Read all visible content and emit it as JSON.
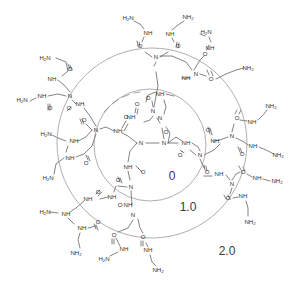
{
  "figure": {
    "type": "chemical-structure-diagram",
    "background_color": "#ffffff",
    "bond_color": "#5a5a5a",
    "circle_color": "#8d8d8d",
    "label_color": "#3a3a3a"
  },
  "generation_labels": [
    {
      "text": "0",
      "x": 172,
      "y": 177
    },
    {
      "text": "1.0",
      "x": 188,
      "y": 208
    },
    {
      "text": "2.0",
      "x": 227,
      "y": 252
    }
  ],
  "generation_circles": [
    {
      "name": "generation-0-boundary",
      "cx": 150,
      "cy": 145,
      "r": 56
    },
    {
      "name": "generation-1-boundary",
      "cx": 152,
      "cy": 143,
      "r": 95
    }
  ],
  "chart_data": {
    "type": "diagram",
    "annotations": [
      "0",
      "1.0",
      "2.0"
    ],
    "core": {
      "label": "ethylenediamine core",
      "atoms": [
        "N",
        "N"
      ]
    },
    "atom_labels": [
      "N",
      "NH",
      "O",
      "NH2",
      "H2N"
    ],
    "generations": [
      {
        "label": "0",
        "radius": 56,
        "terminal_groups": 4
      },
      {
        "label": "1.0",
        "radius": 95,
        "terminal_groups": 8
      },
      {
        "label": "2.0",
        "radius": 140,
        "terminal_groups": 16
      }
    ]
  },
  "atoms": [
    {
      "t": "N",
      "x": 141,
      "y": 143
    },
    {
      "t": "N",
      "x": 164,
      "y": 143
    },
    {
      "t": "NH",
      "x": 118,
      "y": 131
    },
    {
      "t": "O",
      "x": 126,
      "y": 117
    },
    {
      "t": "N",
      "x": 96,
      "y": 130
    },
    {
      "t": "O",
      "x": 84,
      "y": 120
    },
    {
      "t": "NH",
      "x": 74,
      "y": 141
    },
    {
      "t": "H2N",
      "x": 46,
      "y": 134
    },
    {
      "t": "NH",
      "x": 70,
      "y": 158
    },
    {
      "t": "O",
      "x": 86,
      "y": 163
    },
    {
      "t": "H2N",
      "x": 48,
      "y": 178
    },
    {
      "t": "NH",
      "x": 128,
      "y": 167
    },
    {
      "t": "O",
      "x": 143,
      "y": 172
    },
    {
      "t": "N",
      "x": 131,
      "y": 187
    },
    {
      "t": "O",
      "x": 118,
      "y": 180
    },
    {
      "t": "NH",
      "x": 112,
      "y": 197
    },
    {
      "t": "NH",
      "x": 88,
      "y": 199
    },
    {
      "t": "O",
      "x": 98,
      "y": 192
    },
    {
      "t": "H2N",
      "x": 45,
      "y": 212
    },
    {
      "t": "NH",
      "x": 66,
      "y": 214
    },
    {
      "t": "O",
      "x": 98,
      "y": 222
    },
    {
      "t": "NH",
      "x": 82,
      "y": 228
    },
    {
      "t": "NH2",
      "x": 76,
      "y": 253
    },
    {
      "t": "N",
      "x": 133,
      "y": 215
    },
    {
      "t": "O",
      "x": 120,
      "y": 205
    },
    {
      "t": "NH",
      "x": 128,
      "y": 205
    },
    {
      "t": "O",
      "x": 114,
      "y": 235
    },
    {
      "t": "NH",
      "x": 124,
      "y": 249
    },
    {
      "t": "H2N",
      "x": 104,
      "y": 259
    },
    {
      "t": "O",
      "x": 143,
      "y": 237
    },
    {
      "t": "NH",
      "x": 148,
      "y": 250
    },
    {
      "t": "NH2",
      "x": 158,
      "y": 270
    },
    {
      "t": "NH",
      "x": 131,
      "y": 117
    },
    {
      "t": "O",
      "x": 137,
      "y": 104
    },
    {
      "t": "N",
      "x": 153,
      "y": 111
    },
    {
      "t": "O",
      "x": 148,
      "y": 98
    },
    {
      "t": "NH",
      "x": 160,
      "y": 94
    },
    {
      "t": "N",
      "x": 160,
      "y": 118
    },
    {
      "t": "N",
      "x": 156,
      "y": 57
    },
    {
      "t": "O",
      "x": 140,
      "y": 46
    },
    {
      "t": "NH",
      "x": 148,
      "y": 33
    },
    {
      "t": "H2N",
      "x": 128,
      "y": 18
    },
    {
      "t": "NH",
      "x": 170,
      "y": 34
    },
    {
      "t": "O",
      "x": 178,
      "y": 46
    },
    {
      "t": "NH2",
      "x": 188,
      "y": 17
    },
    {
      "t": "N",
      "x": 196,
      "y": 74
    },
    {
      "t": "NH",
      "x": 186,
      "y": 78
    },
    {
      "t": "O",
      "x": 205,
      "y": 54
    },
    {
      "t": "NH",
      "x": 210,
      "y": 48
    },
    {
      "t": "H2N",
      "x": 206,
      "y": 32
    },
    {
      "t": "O",
      "x": 211,
      "y": 79
    },
    {
      "t": "NH2",
      "x": 248,
      "y": 68
    },
    {
      "t": "NH",
      "x": 186,
      "y": 143
    },
    {
      "t": "O",
      "x": 180,
      "y": 155
    },
    {
      "t": "N",
      "x": 200,
      "y": 155
    },
    {
      "t": "O",
      "x": 166,
      "y": 132
    },
    {
      "t": "N",
      "x": 232,
      "y": 136
    },
    {
      "t": "O",
      "x": 237,
      "y": 118
    },
    {
      "t": "NH",
      "x": 252,
      "y": 122
    },
    {
      "t": "NH2",
      "x": 271,
      "y": 106
    },
    {
      "t": "NH",
      "x": 253,
      "y": 146
    },
    {
      "t": "O",
      "x": 242,
      "y": 154
    },
    {
      "t": "NH2",
      "x": 278,
      "y": 155
    },
    {
      "t": "NH",
      "x": 215,
      "y": 141
    },
    {
      "t": "O",
      "x": 208,
      "y": 130
    },
    {
      "t": "O",
      "x": 207,
      "y": 172
    },
    {
      "t": "NH",
      "x": 219,
      "y": 174
    },
    {
      "t": "N",
      "x": 232,
      "y": 184
    },
    {
      "t": "O",
      "x": 243,
      "y": 172
    },
    {
      "t": "NH",
      "x": 257,
      "y": 178
    },
    {
      "t": "NH2",
      "x": 277,
      "y": 181
    },
    {
      "t": "O",
      "x": 228,
      "y": 198
    },
    {
      "t": "NH",
      "x": 243,
      "y": 196
    },
    {
      "t": "NH2",
      "x": 250,
      "y": 222
    },
    {
      "t": "NH",
      "x": 80,
      "y": 104
    },
    {
      "t": "O",
      "x": 69,
      "y": 108
    },
    {
      "t": "N",
      "x": 70,
      "y": 96
    },
    {
      "t": "NH",
      "x": 42,
      "y": 96
    },
    {
      "t": "H2N",
      "x": 22,
      "y": 100
    },
    {
      "t": "O",
      "x": 50,
      "y": 108
    },
    {
      "t": "NH",
      "x": 52,
      "y": 79
    },
    {
      "t": "O",
      "x": 70,
      "y": 69
    },
    {
      "t": "H2N",
      "x": 45,
      "y": 58
    }
  ]
}
